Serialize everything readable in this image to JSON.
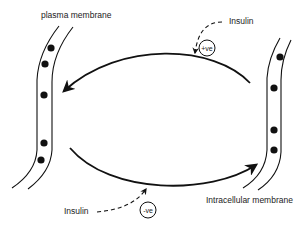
{
  "diagram": {
    "labels": {
      "plasma_membrane": "plasma membrane",
      "intracellular_membrane": "Intracellular membrane",
      "insulin_top": "Insulin",
      "insulin_bottom": "Insulin"
    },
    "effects": {
      "positive": "+ve",
      "negative": "-ve"
    },
    "colors": {
      "line": "#111111",
      "background": "#ffffff"
    },
    "membranes": [
      {
        "name": "plasma membrane",
        "vesicle_count": 5
      },
      {
        "name": "Intracellular membrane",
        "vesicle_count": 4
      }
    ],
    "arrows": [
      {
        "from": "Intracellular membrane",
        "to": "plasma membrane",
        "modulator": "Insulin",
        "effect": "+ve"
      },
      {
        "from": "plasma membrane",
        "to": "Intracellular membrane",
        "modulator": "Insulin",
        "effect": "-ve"
      }
    ]
  }
}
